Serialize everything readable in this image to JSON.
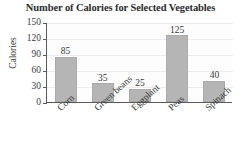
{
  "chart_data": {
    "type": "bar",
    "title": "Number of Calories for Selected Vegetables",
    "xlabel": "",
    "ylabel": "Calories",
    "categories": [
      "Corn",
      "Green beans",
      "Eggplant",
      "Peas",
      "Spinach"
    ],
    "values": [
      85,
      35,
      25,
      125,
      40
    ],
    "value_labels": [
      "85",
      "35",
      "25",
      "125",
      "40"
    ],
    "ylim": [
      0,
      150
    ],
    "yticks": [
      0,
      30,
      60,
      90,
      120,
      150
    ],
    "ytick_labels": [
      "0",
      "30",
      "60",
      "90",
      "120",
      "150"
    ],
    "grid": true,
    "legend": null,
    "bar_color": "#b5b5b5",
    "axis_color": "#5a5a5a",
    "grid_color": "#ececec",
    "text_color": "#3a3a3a"
  }
}
